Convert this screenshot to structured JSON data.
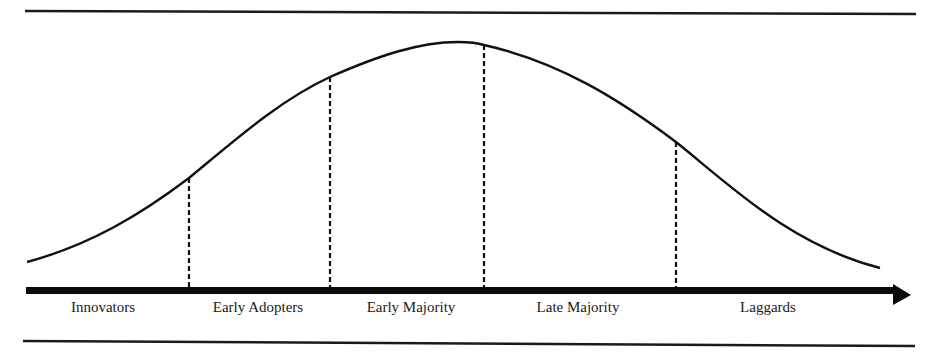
{
  "diagram": {
    "title": "",
    "type": "diffusion-of-innovations-bell-curve",
    "colors": {
      "stroke": "#111111",
      "background": "#ffffff"
    },
    "axis": {
      "direction": "left-to-right",
      "arrow": true
    },
    "segments": [
      {
        "label": "Innovators",
        "center_x": 103
      },
      {
        "label": "Early Adopters",
        "center_x": 258
      },
      {
        "label": "Early Majority",
        "center_x": 411
      },
      {
        "label": "Late Majority",
        "center_x": 578
      },
      {
        "label": "Laggards",
        "center_x": 768
      }
    ],
    "dividers": [
      {
        "x": 189,
        "curve_y": 178
      },
      {
        "x": 330,
        "curve_y": 77
      },
      {
        "x": 484,
        "curve_y": 45
      },
      {
        "x": 676,
        "curve_y": 142
      }
    ]
  }
}
